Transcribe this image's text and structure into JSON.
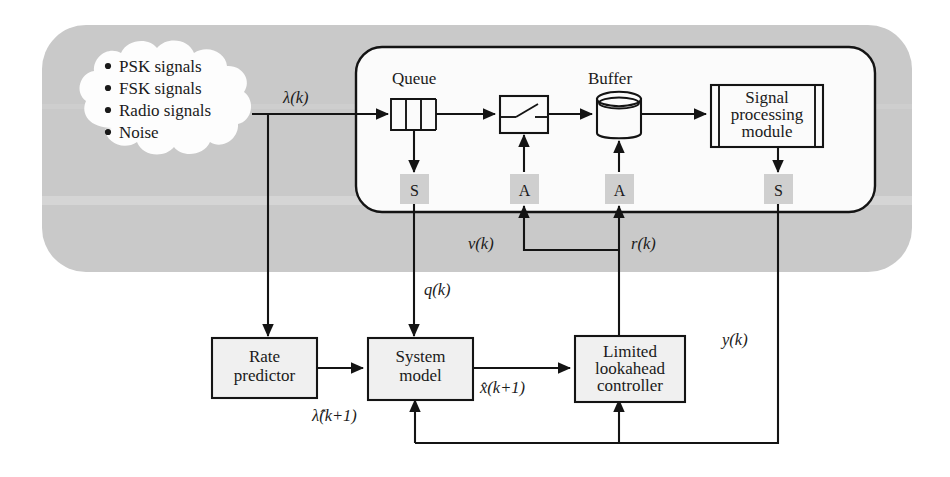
{
  "figure": {
    "background_color": "#ffffff",
    "band_color": "#c9c9c9",
    "panel_color": "#fbfbfb",
    "box_fill": "#f0f0f0",
    "sa_fill": "#cfcfcf",
    "line_color": "#141414"
  },
  "cloud": {
    "name": "signal-sources-cloud",
    "items": [
      "PSK signals",
      "FSK signals",
      "Radio signals",
      "Noise"
    ]
  },
  "captions": {
    "queue": "Queue",
    "buffer": "Buffer"
  },
  "plant": {
    "queue": {
      "label": "Queue",
      "cells": 3
    },
    "switch": {
      "label": "switch"
    },
    "buffer": {
      "label": "Buffer"
    },
    "spm": {
      "line1": "Signal",
      "line2": "processing",
      "line3": "module"
    }
  },
  "sa_nodes": [
    {
      "id": "s-queue",
      "label": "S",
      "kind": "sensor"
    },
    {
      "id": "a-switch",
      "label": "A",
      "kind": "actuator"
    },
    {
      "id": "a-buffer",
      "label": "A",
      "kind": "actuator"
    },
    {
      "id": "s-spm",
      "label": "S",
      "kind": "sensor"
    }
  ],
  "controller_boxes": [
    {
      "id": "rate-predictor",
      "line1": "Rate",
      "line2": "predictor",
      "line3": ""
    },
    {
      "id": "system-model",
      "line1": "System",
      "line2": "model",
      "line3": ""
    },
    {
      "id": "limited-lookahead-controller",
      "line1": "Limited",
      "line2": "lookahead",
      "line3": "controller"
    }
  ],
  "signals": {
    "lambda": "λ(k)",
    "lambda_hat": "λ̂(k+1)",
    "q": "q(k)",
    "nu": "ν(k)",
    "r": "r(k)",
    "x_hat": "x̂(k+1)",
    "y": "y(k)"
  }
}
